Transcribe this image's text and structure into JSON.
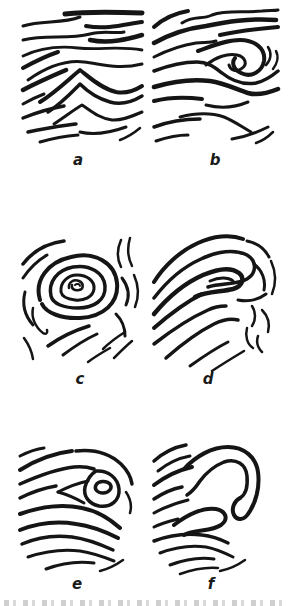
{
  "figure": {
    "background_color": "#ffffff",
    "ink_color": "#151515",
    "panels": [
      {
        "label": "a",
        "pattern": "arched-layers-central-crest"
      },
      {
        "label": "b",
        "pattern": "inclined-layers-fold-nose"
      },
      {
        "label": "c",
        "pattern": "concentric-whorl"
      },
      {
        "label": "d",
        "pattern": "nested-hairpin-folds"
      },
      {
        "label": "e",
        "pattern": "eye-fold-closure"
      },
      {
        "label": "f",
        "pattern": "pendant-hook-fold"
      }
    ]
  }
}
